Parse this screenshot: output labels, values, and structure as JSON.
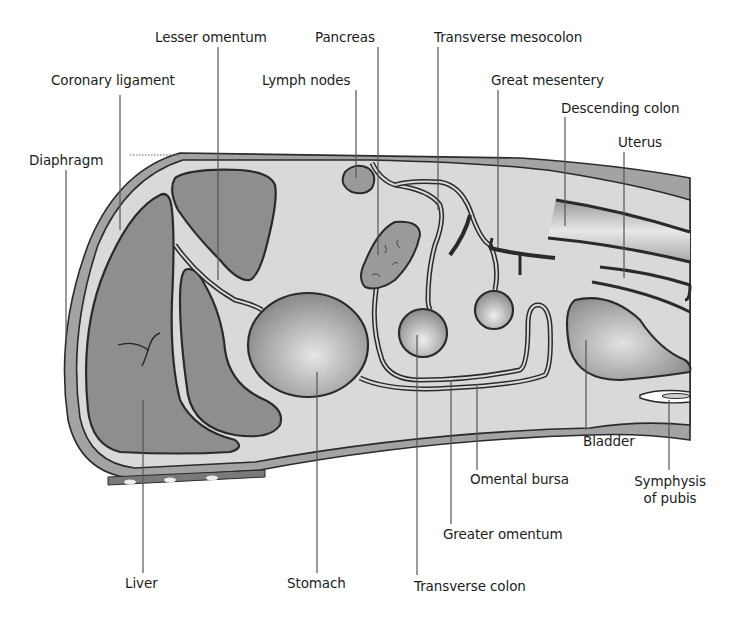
{
  "colors": {
    "background": "#ffffff",
    "peritoneal_cavity": "#d9d9d9",
    "organ_dark": "#8c8c8c",
    "wall": "#a3a3a3",
    "outline": "#2a2a2a",
    "leader_line": "#555555",
    "label_text": "#1c1c1c"
  },
  "labels": {
    "lesser_omentum": "Lesser omentum",
    "pancreas": "Pancreas",
    "transverse_mesocolon": "Transverse mesocolon",
    "coronary_ligament": "Coronary ligament",
    "lymph_nodes": "Lymph nodes",
    "great_mesentery": "Great mesentery",
    "descending_colon": "Descending colon",
    "uterus": "Uterus",
    "diaphragm": "Diaphragm",
    "bladder": "Bladder",
    "symphysis_of_pubis_line1": "Symphysis",
    "symphysis_of_pubis_line2": "of pubis",
    "omental_bursa": "Omental bursa",
    "greater_omentum": "Greater omentum",
    "liver": "Liver",
    "stomach": "Stomach",
    "transverse_colon": "Transverse colon"
  }
}
